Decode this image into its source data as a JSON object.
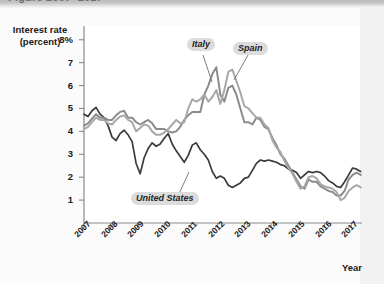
{
  "figure": {
    "clipped_title": "Figure 2007–2017",
    "background": "#ffffff",
    "plot_background": "#ffffff"
  },
  "axis": {
    "y_label_line1": "Interest rate",
    "y_label_line2": "(percent)",
    "x_title": "Year",
    "y_ticks": [
      "8%",
      "7",
      "6",
      "5",
      "4",
      "3",
      "2",
      "1"
    ],
    "x_ticks": [
      "2007",
      "2008",
      "2009",
      "2010",
      "2011",
      "2012",
      "2013",
      "2014",
      "2015",
      "2016",
      "2017"
    ]
  },
  "labels": {
    "italy": "Italy",
    "spain": "Spain",
    "united_states": "United States"
  },
  "colors": {
    "italy": "#8c8c8c",
    "spain": "#a8a8a8",
    "united_states": "#3b3b3b",
    "axis": "#808080",
    "label_box": "#dcdcdc",
    "text": "#1a1a1a"
  },
  "chart_data": {
    "type": "line",
    "title": "",
    "xlabel": "Year",
    "ylabel": "Interest rate (percent)",
    "xlim": [
      2007,
      2017.4
    ],
    "ylim": [
      0,
      8.6
    ],
    "yticks": [
      1,
      2,
      3,
      4,
      5,
      6,
      7,
      8
    ],
    "xticks": [
      2007,
      2008,
      2009,
      2010,
      2011,
      2012,
      2013,
      2014,
      2015,
      2016,
      2017
    ],
    "grid": false,
    "legend": "inline-annotations",
    "series": [
      {
        "name": "United States",
        "color": "#3b3b3b",
        "x": [
          2007.0,
          2007.15,
          2007.3,
          2007.45,
          2007.6,
          2007.75,
          2007.9,
          2008.05,
          2008.2,
          2008.35,
          2008.5,
          2008.65,
          2008.8,
          2008.95,
          2009.1,
          2009.25,
          2009.4,
          2009.55,
          2009.7,
          2009.85,
          2010.0,
          2010.15,
          2010.3,
          2010.45,
          2010.6,
          2010.75,
          2010.9,
          2011.05,
          2011.2,
          2011.35,
          2011.5,
          2011.65,
          2011.8,
          2011.95,
          2012.1,
          2012.25,
          2012.4,
          2012.55,
          2012.7,
          2012.85,
          2013.0,
          2013.15,
          2013.3,
          2013.45,
          2013.6,
          2013.75,
          2013.9,
          2014.05,
          2014.2,
          2014.35,
          2014.5,
          2014.65,
          2014.8,
          2014.95,
          2015.1,
          2015.25,
          2015.4,
          2015.55,
          2015.7,
          2015.85,
          2016.0,
          2016.15,
          2016.3,
          2016.45,
          2016.6,
          2016.75,
          2016.9,
          2017.05,
          2017.2,
          2017.35
        ],
        "y": [
          4.75,
          4.65,
          4.9,
          5.05,
          4.75,
          4.6,
          4.25,
          3.75,
          3.6,
          3.9,
          4.05,
          3.85,
          3.55,
          2.6,
          2.15,
          2.85,
          3.25,
          3.5,
          3.35,
          3.45,
          3.7,
          3.9,
          3.45,
          3.15,
          2.9,
          2.65,
          2.95,
          3.4,
          3.5,
          3.2,
          3.0,
          2.75,
          2.25,
          1.95,
          2.05,
          1.95,
          1.65,
          1.55,
          1.65,
          1.75,
          1.95,
          2.0,
          2.3,
          2.6,
          2.75,
          2.7,
          2.75,
          2.7,
          2.65,
          2.55,
          2.5,
          2.35,
          2.3,
          2.2,
          1.95,
          2.1,
          2.25,
          2.2,
          2.25,
          2.2,
          2.05,
          1.85,
          1.75,
          1.6,
          1.55,
          1.8,
          2.1,
          2.4,
          2.35,
          2.25
        ]
      },
      {
        "name": "Italy",
        "color": "#8c8c8c",
        "x": [
          2007.0,
          2007.15,
          2007.3,
          2007.45,
          2007.6,
          2007.75,
          2007.9,
          2008.05,
          2008.2,
          2008.35,
          2008.5,
          2008.65,
          2008.8,
          2008.95,
          2009.1,
          2009.25,
          2009.4,
          2009.55,
          2009.7,
          2009.85,
          2010.0,
          2010.15,
          2010.3,
          2010.45,
          2010.6,
          2010.75,
          2010.9,
          2011.05,
          2011.2,
          2011.35,
          2011.5,
          2011.65,
          2011.8,
          2011.95,
          2012.1,
          2012.25,
          2012.4,
          2012.55,
          2012.7,
          2012.85,
          2013.0,
          2013.15,
          2013.3,
          2013.45,
          2013.6,
          2013.75,
          2013.9,
          2014.05,
          2014.2,
          2014.35,
          2014.5,
          2014.65,
          2014.8,
          2014.95,
          2015.1,
          2015.25,
          2015.4,
          2015.55,
          2015.7,
          2015.85,
          2016.0,
          2016.15,
          2016.3,
          2016.45,
          2016.6,
          2016.75,
          2016.9,
          2017.05,
          2017.2,
          2017.35
        ],
        "y": [
          4.25,
          4.35,
          4.55,
          4.75,
          4.6,
          4.6,
          4.5,
          4.5,
          4.7,
          4.85,
          4.9,
          4.6,
          4.6,
          4.4,
          4.3,
          4.4,
          4.5,
          4.35,
          4.1,
          4.1,
          4.1,
          4.0,
          3.95,
          4.0,
          4.2,
          4.5,
          4.7,
          4.85,
          4.85,
          4.85,
          5.6,
          6.0,
          6.5,
          6.8,
          5.6,
          5.3,
          5.9,
          6.0,
          5.6,
          5.0,
          4.4,
          4.4,
          4.3,
          4.6,
          4.5,
          4.2,
          4.1,
          3.7,
          3.4,
          3.0,
          2.8,
          2.5,
          2.2,
          1.9,
          1.6,
          1.5,
          1.9,
          1.8,
          1.8,
          1.6,
          1.5,
          1.4,
          1.35,
          1.2,
          1.2,
          1.4,
          1.9,
          2.1,
          2.2,
          2.1
        ]
      },
      {
        "name": "Spain",
        "color": "#a8a8a8",
        "x": [
          2007.0,
          2007.15,
          2007.3,
          2007.45,
          2007.6,
          2007.75,
          2007.9,
          2008.05,
          2008.2,
          2008.35,
          2008.5,
          2008.65,
          2008.8,
          2008.95,
          2009.1,
          2009.25,
          2009.4,
          2009.55,
          2009.7,
          2009.85,
          2010.0,
          2010.15,
          2010.3,
          2010.45,
          2010.6,
          2010.75,
          2010.9,
          2011.05,
          2011.2,
          2011.35,
          2011.5,
          2011.65,
          2011.8,
          2011.95,
          2012.1,
          2012.25,
          2012.4,
          2012.55,
          2012.7,
          2012.85,
          2013.0,
          2013.15,
          2013.3,
          2013.45,
          2013.6,
          2013.75,
          2013.9,
          2014.05,
          2014.2,
          2014.35,
          2014.5,
          2014.65,
          2014.8,
          2014.95,
          2015.1,
          2015.25,
          2015.4,
          2015.55,
          2015.7,
          2015.85,
          2016.0,
          2016.15,
          2016.3,
          2016.45,
          2016.6,
          2016.75,
          2016.9,
          2017.05,
          2017.2,
          2017.35
        ],
        "y": [
          4.1,
          4.2,
          4.4,
          4.6,
          4.5,
          4.5,
          4.35,
          4.3,
          4.5,
          4.65,
          4.7,
          4.5,
          4.4,
          4.0,
          4.15,
          4.3,
          4.25,
          4.0,
          3.85,
          3.85,
          3.95,
          4.1,
          4.3,
          4.5,
          4.35,
          4.4,
          5.0,
          5.4,
          5.3,
          5.4,
          5.6,
          5.3,
          5.5,
          5.8,
          5.2,
          5.8,
          6.6,
          6.7,
          6.2,
          5.7,
          5.1,
          5.0,
          4.8,
          4.6,
          4.6,
          4.3,
          4.15,
          3.6,
          3.3,
          3.1,
          2.7,
          2.4,
          2.15,
          1.8,
          1.5,
          1.6,
          2.0,
          2.05,
          1.95,
          1.7,
          1.6,
          1.55,
          1.5,
          1.35,
          1.0,
          1.1,
          1.4,
          1.55,
          1.65,
          1.55
        ]
      }
    ]
  }
}
